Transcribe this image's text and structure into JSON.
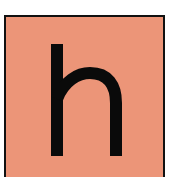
{
  "card": {
    "letter": "h",
    "background_color": "#ec9578",
    "border_color": "#111111",
    "letter_color": "#0a0a0a"
  }
}
